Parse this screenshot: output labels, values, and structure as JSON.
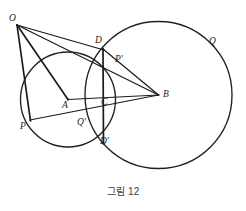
{
  "figure": {
    "caption": "그림 12",
    "type": "geometry-diagram",
    "canvas": {
      "width": 246,
      "height": 211
    },
    "circles": [
      {
        "name": "circle-A",
        "center_label": "A",
        "cx": 68,
        "cy": 99.5,
        "r": 47.5
      },
      {
        "name": "circle-B",
        "center_label": "B",
        "cx": 158.5,
        "cy": 95,
        "r": 73.5
      }
    ],
    "points": [
      {
        "id": "O",
        "label": "O",
        "x": 17,
        "y": 25,
        "label_x": 11,
        "label_y": 16
      },
      {
        "id": "D",
        "label": "D",
        "x": 103,
        "y": 49,
        "label_x": 96,
        "label_y": 38
      },
      {
        "id": "Pp",
        "label": "P'",
        "x": 114,
        "y": 67,
        "label_x": 116,
        "label_y": 58
      },
      {
        "id": "Q",
        "label": "Q",
        "x": 208,
        "y": 44,
        "label_x": 210,
        "label_y": 39
      },
      {
        "id": "A",
        "label": "A",
        "x": 68,
        "y": 99.5,
        "label_x": 63,
        "label_y": 96
      },
      {
        "id": "C",
        "label": "C",
        "x": 103,
        "y": 99,
        "label_x": 101,
        "label_y": 96
      },
      {
        "id": "B",
        "label": "B",
        "x": 158.5,
        "y": 95,
        "label_x": 162,
        "label_y": 88
      },
      {
        "id": "P",
        "label": "P",
        "x": 30,
        "y": 118,
        "label_x": 22,
        "label_y": 119
      },
      {
        "id": "Qp",
        "label": "Q'",
        "x": 84,
        "y": 116,
        "label_x": 78,
        "label_y": 117
      },
      {
        "id": "Dp",
        "label": "D'",
        "x": 103,
        "y": 143,
        "label_x": 100,
        "label_y": 135
      }
    ],
    "segments": [
      {
        "name": "segment-O-P",
        "from": "O",
        "to": "P",
        "x1": 17,
        "y1": 25,
        "x2": 30,
        "y2": 120
      },
      {
        "name": "segment-O-B",
        "from": "O",
        "to": "B",
        "x1": 17,
        "y1": 25,
        "x2": 158.5,
        "y2": 95
      },
      {
        "name": "segment-O-D",
        "from": "O",
        "to": "D",
        "x1": 17,
        "y1": 25,
        "x2": 103,
        "y2": 49
      },
      {
        "name": "segment-O-A",
        "from": "O",
        "to": "A",
        "x1": 17,
        "y1": 25,
        "x2": 68,
        "y2": 99.5
      },
      {
        "name": "segment-D-Dprime",
        "from": "D",
        "to": "D'",
        "x1": 103,
        "y1": 49,
        "x2": 103,
        "y2": 143
      },
      {
        "name": "segment-A-B",
        "from": "A",
        "to": "B",
        "x1": 68,
        "y1": 99.5,
        "x2": 158.5,
        "y2": 95
      },
      {
        "name": "segment-P-B",
        "from": "P",
        "to": "B",
        "x1": 30,
        "y1": 119,
        "x2": 158.5,
        "y2": 95
      },
      {
        "name": "segment-D-B",
        "from": "D",
        "to": "B",
        "x1": 103,
        "y1": 49,
        "x2": 158.5,
        "y2": 95
      },
      {
        "name": "segment-D-Pprime-extended",
        "from": "D",
        "to": "P'",
        "x1": 103,
        "y1": 49,
        "x2": 120,
        "y2": 73
      }
    ],
    "labels_note": "points of intersection of the two circles are D (upper) and D' (lower); C is on AB"
  }
}
